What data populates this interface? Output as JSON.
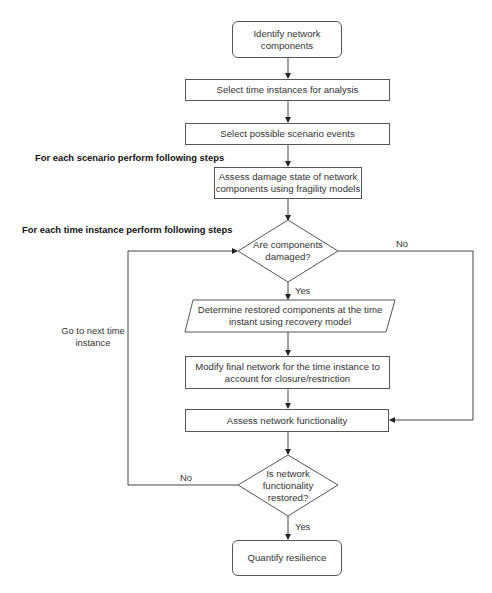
{
  "diagram": {
    "type": "flowchart",
    "stroke_color": "#555555",
    "nodes": [
      {
        "id": "start",
        "shape": "rounded-rect",
        "label": "Identify network components"
      },
      {
        "id": "time",
        "shape": "rect",
        "label": "Select time instances for analysis"
      },
      {
        "id": "scenario",
        "shape": "rect",
        "label": "Select possible scenario events"
      },
      {
        "id": "damage",
        "shape": "rect",
        "label": "Assess damage state of network components using fragility models"
      },
      {
        "id": "decision1",
        "shape": "diamond",
        "label": "Are components damaged?"
      },
      {
        "id": "restore",
        "shape": "parallelogram",
        "label": "Determine restored components at the time instant using recovery model"
      },
      {
        "id": "modify",
        "shape": "rect",
        "label": "Modify final network for the time instance to account for closure/restriction"
      },
      {
        "id": "assess",
        "shape": "rect",
        "label": "Assess network functionality"
      },
      {
        "id": "decision2",
        "shape": "diamond",
        "label": "Is network functionality restored?"
      },
      {
        "id": "end",
        "shape": "rounded-rect",
        "label": "Quantify resilience"
      }
    ],
    "edges": [
      {
        "from": "start",
        "to": "time",
        "label": ""
      },
      {
        "from": "time",
        "to": "scenario",
        "label": ""
      },
      {
        "from": "scenario",
        "to": "damage",
        "label": ""
      },
      {
        "from": "damage",
        "to": "decision1",
        "label": ""
      },
      {
        "from": "decision1",
        "to": "restore",
        "label": "Yes"
      },
      {
        "from": "decision1",
        "to": "assess",
        "label": "No"
      },
      {
        "from": "restore",
        "to": "modify",
        "label": ""
      },
      {
        "from": "modify",
        "to": "assess",
        "label": ""
      },
      {
        "from": "assess",
        "to": "decision2",
        "label": ""
      },
      {
        "from": "decision2",
        "to": "end",
        "label": "Yes"
      },
      {
        "from": "decision2",
        "to": "decision1",
        "label": "No"
      }
    ],
    "sections": {
      "scenario_loop": "For each scenario perform following steps",
      "time_loop": "For each time instance perform following steps"
    },
    "labels": {
      "d1_no": "No",
      "d1_yes": "Yes",
      "d2_no": "No",
      "d2_yes": "Yes",
      "loop_line1": "Go to next time",
      "loop_line2": "instance"
    },
    "text": {
      "start_l1": "Identify network",
      "start_l2": "components",
      "time": "Select time instances for analysis",
      "scenario": "Select possible scenario events",
      "damage_l1": "Assess damage state of network",
      "damage_l2": "components using fragility models",
      "d1_l1": "Are components",
      "d1_l2": "damaged?",
      "restore_l1": "Determine restored components at the time",
      "restore_l2": "instant using recovery model",
      "modify_l1": "Modify final network for the time instance to",
      "modify_l2": "account for closure/restriction",
      "assess": "Assess network functionality",
      "d2_l1": "Is network",
      "d2_l2": "functionality",
      "d2_l3": "restored?",
      "end": "Quantify resilience"
    }
  }
}
